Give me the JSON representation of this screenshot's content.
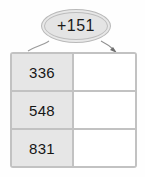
{
  "worksheet": {
    "rule": {
      "label": "+151",
      "operator": "+",
      "operand": 151
    },
    "table": {
      "columns": [
        "input",
        "output"
      ],
      "rows": [
        {
          "input": "336",
          "output": ""
        },
        {
          "input": "548",
          "output": ""
        },
        {
          "input": "831",
          "output": ""
        }
      ]
    },
    "arrows": [
      {
        "name": "arrow-to-input-column",
        "from": "rule-oval",
        "to": "input-column",
        "has_head": false
      },
      {
        "name": "arrow-to-output-column",
        "from": "rule-oval",
        "to": "output-column",
        "has_head": true
      }
    ],
    "colors": {
      "input_cell_fill": "#e6e6e6",
      "output_cell_fill": "#ffffff",
      "border": "#c2c2c2",
      "oval_fill": "#e8e8e8",
      "oval_border": "#b9b9b9",
      "text": "#161616",
      "arrow": "#8f8f8f"
    }
  }
}
